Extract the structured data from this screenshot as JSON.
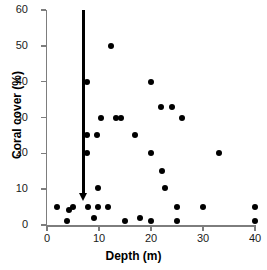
{
  "chart_data": {
    "type": "scatter",
    "title": "",
    "xlabel": "Depth (m)",
    "ylabel": "Coral cover (%)",
    "xlim": [
      0,
      40
    ],
    "ylim": [
      0,
      60
    ],
    "xticks": [
      0,
      10,
      20,
      30,
      40
    ],
    "yticks": [
      0,
      10,
      20,
      30,
      40,
      50,
      60
    ],
    "xtick_labels": [
      "0",
      "10",
      "20",
      "30",
      "40"
    ],
    "ytick_labels": [
      "0",
      "10",
      "20",
      "30",
      "40",
      "50",
      "60"
    ],
    "grid": false,
    "legend": null,
    "marker": {
      "shape": "circle",
      "color": "#000000",
      "size": 6
    },
    "points": [
      {
        "x": 2.0,
        "y": 5.0
      },
      {
        "x": 3.8,
        "y": 1.2
      },
      {
        "x": 4.2,
        "y": 4.2
      },
      {
        "x": 5.0,
        "y": 5.0
      },
      {
        "x": 7.6,
        "y": 40.0
      },
      {
        "x": 7.6,
        "y": 25.0
      },
      {
        "x": 7.6,
        "y": 20.2
      },
      {
        "x": 7.8,
        "y": 5.0
      },
      {
        "x": 9.0,
        "y": 2.0
      },
      {
        "x": 9.6,
        "y": 25.0
      },
      {
        "x": 9.8,
        "y": 10.2
      },
      {
        "x": 9.8,
        "y": 5.0
      },
      {
        "x": 10.4,
        "y": 30.0
      },
      {
        "x": 11.8,
        "y": 5.0
      },
      {
        "x": 12.4,
        "y": 50.0
      },
      {
        "x": 13.2,
        "y": 30.0
      },
      {
        "x": 14.2,
        "y": 30.0
      },
      {
        "x": 15.0,
        "y": 1.2
      },
      {
        "x": 17.0,
        "y": 25.2
      },
      {
        "x": 17.8,
        "y": 2.0
      },
      {
        "x": 20.0,
        "y": 40.0
      },
      {
        "x": 20.0,
        "y": 20.2
      },
      {
        "x": 20.0,
        "y": 1.2
      },
      {
        "x": 22.0,
        "y": 33.0
      },
      {
        "x": 22.2,
        "y": 15.2
      },
      {
        "x": 22.6,
        "y": 10.2
      },
      {
        "x": 24.0,
        "y": 33.0
      },
      {
        "x": 25.0,
        "y": 5.0
      },
      {
        "x": 25.0,
        "y": 1.2
      },
      {
        "x": 26.0,
        "y": 30.0
      },
      {
        "x": 30.0,
        "y": 5.0
      },
      {
        "x": 33.0,
        "y": 20.2
      },
      {
        "x": 40.0,
        "y": 5.0
      },
      {
        "x": 40.0,
        "y": 1.2
      }
    ],
    "annotations": [
      {
        "name": "threshold-arrow",
        "type": "arrow",
        "orientation": "vertical-down",
        "x": 7.0,
        "y_start": 60.0,
        "y_end": 7.0,
        "color": "#000000"
      }
    ]
  }
}
